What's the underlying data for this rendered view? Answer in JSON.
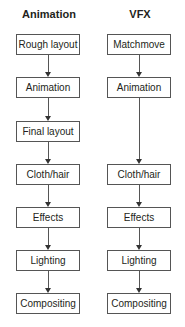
{
  "columns": [
    {
      "title": "Animation",
      "steps": [
        "Rough layout",
        "Animation",
        "Final layout",
        "Cloth/hair",
        "Effects",
        "Lighting",
        "Compositing"
      ]
    },
    {
      "title": "VFX",
      "steps": [
        "Matchmove",
        "Animation",
        "Cloth/hair",
        "Effects",
        "Lighting",
        "Compositing"
      ]
    }
  ]
}
